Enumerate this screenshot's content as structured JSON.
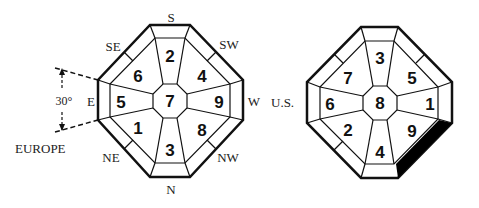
{
  "diagrams": [
    {
      "name": "europe",
      "label": "EUROPE",
      "angle_label": "30°",
      "directions": {
        "S": "S",
        "SW": "SW",
        "W": "W",
        "NW": "NW",
        "N": "N",
        "NE": "NE",
        "E": "E",
        "SE": "SE"
      },
      "cells": {
        "center": "7",
        "top": "2",
        "top_right": "4",
        "right": "9",
        "bottom_right": "8",
        "bottom": "3",
        "bottom_left": "1",
        "left": "5",
        "top_left": "6"
      }
    },
    {
      "name": "us",
      "label": "U.S.",
      "cells": {
        "center": "8",
        "top": "3",
        "top_right": "5",
        "right": "1",
        "bottom_right": "9",
        "bottom": "4",
        "bottom_left": "2",
        "left": "6",
        "top_left": "7"
      },
      "highlight_segment": "bottom-right outer edge (black)"
    }
  ],
  "colors": {
    "stroke": "#111111",
    "background": "#ffffff",
    "fill_highlight": "#000000"
  }
}
